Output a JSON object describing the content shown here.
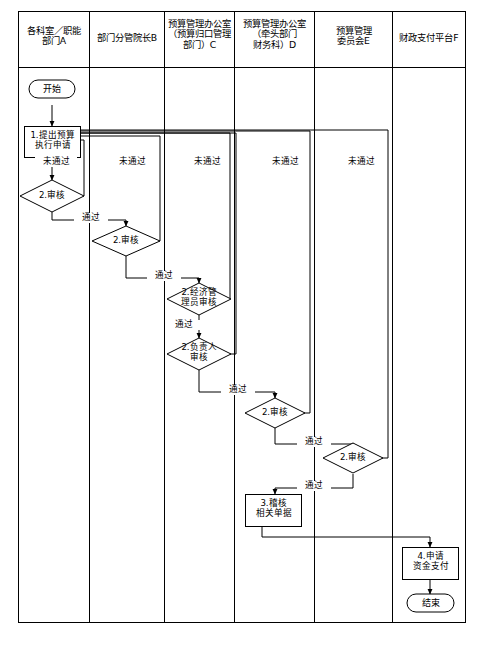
{
  "diagram": {
    "type": "swimlane-flowchart",
    "orientation": "vertical-swimlanes",
    "line_color": "#000000",
    "fill_color": "#ffffff",
    "background": "#ffffff"
  },
  "lanes": [
    {
      "id": "A",
      "label": "各科室／职能\n部门A"
    },
    {
      "id": "B",
      "label": "部门分管院长B"
    },
    {
      "id": "C",
      "label": "预算管理办公室\n（预算归口管理\n部门）C"
    },
    {
      "id": "D",
      "label": "预算管理办公室\n（牵头部门\n财务科）D"
    },
    {
      "id": "E",
      "label": "预算管理\n委员会E"
    },
    {
      "id": "F",
      "label": "财政支付平台F"
    }
  ],
  "nodes": [
    {
      "id": "start",
      "lane": "A",
      "shape": "terminator",
      "label": "开始"
    },
    {
      "id": "n1",
      "lane": "A",
      "shape": "process",
      "label": "1.提出预算\n执行申请"
    },
    {
      "id": "d1",
      "lane": "A",
      "shape": "decision",
      "label": "2.审核"
    },
    {
      "id": "d2",
      "lane": "B",
      "shape": "decision",
      "label": "2.审核"
    },
    {
      "id": "d3",
      "lane": "C",
      "shape": "decision",
      "label": "2.经济管\n理员审核"
    },
    {
      "id": "d4",
      "lane": "C",
      "shape": "decision",
      "label": "2.负责人\n审核"
    },
    {
      "id": "d5",
      "lane": "D",
      "shape": "decision",
      "label": "2.审核"
    },
    {
      "id": "d6",
      "lane": "E",
      "shape": "decision",
      "label": "2.审核"
    },
    {
      "id": "n3",
      "lane": "D",
      "shape": "process",
      "label": "3.稽核\n相关单据"
    },
    {
      "id": "n4",
      "lane": "F",
      "shape": "process",
      "label": "4.申请\n资金支付"
    },
    {
      "id": "end",
      "lane": "F",
      "shape": "terminator",
      "label": "结束"
    }
  ],
  "edge_labels": {
    "pass": "通过",
    "fail": "未通过"
  },
  "edges": [
    {
      "from": "start",
      "to": "n1",
      "label": ""
    },
    {
      "from": "n1",
      "to": "d1",
      "label": ""
    },
    {
      "from": "d1",
      "to": "n1",
      "label": "未通过"
    },
    {
      "from": "d1",
      "to": "d2",
      "label": "通过"
    },
    {
      "from": "d2",
      "to": "n1",
      "label": "未通过"
    },
    {
      "from": "d2",
      "to": "d3",
      "label": "通过"
    },
    {
      "from": "d3",
      "to": "n1",
      "label": "未通过"
    },
    {
      "from": "d3",
      "to": "d4",
      "label": "通过"
    },
    {
      "from": "d4",
      "to": "n1",
      "label": "未通过"
    },
    {
      "from": "d4",
      "to": "d5",
      "label": "通过"
    },
    {
      "from": "d5",
      "to": "n1",
      "label": "未通过"
    },
    {
      "from": "d5",
      "to": "d6",
      "label": "通过"
    },
    {
      "from": "d6",
      "to": "n1",
      "label": "未通过"
    },
    {
      "from": "d6",
      "to": "n3",
      "label": "通过"
    },
    {
      "from": "n3",
      "to": "n4",
      "label": ""
    },
    {
      "from": "n4",
      "to": "end",
      "label": ""
    }
  ],
  "fail_labels": [
    {
      "text": "未通过",
      "x": 54,
      "y": 157
    },
    {
      "text": "未通过",
      "x": 130,
      "y": 157
    },
    {
      "text": "未通过",
      "x": 205,
      "y": 157
    },
    {
      "text": "未通过",
      "x": 283,
      "y": 157
    },
    {
      "text": "未通过",
      "x": 359,
      "y": 157
    }
  ],
  "pass_labels": [
    {
      "text": "通过",
      "x": 74,
      "y": 212
    },
    {
      "text": "通过",
      "x": 150,
      "y": 270
    },
    {
      "text": "通过",
      "x": 175,
      "y": 325
    },
    {
      "text": "通过",
      "x": 224,
      "y": 385
    },
    {
      "text": "通过",
      "x": 299,
      "y": 438
    },
    {
      "text": "通过",
      "x": 299,
      "y": 481
    }
  ]
}
